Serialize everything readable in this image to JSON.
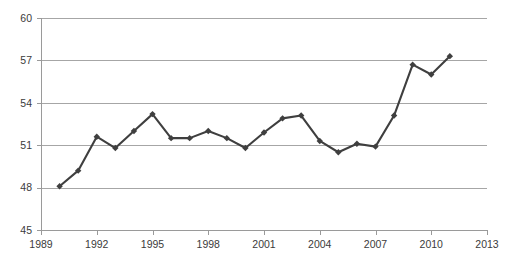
{
  "chart_data": {
    "type": "line",
    "title": "",
    "subtitle": "",
    "xlabel": "",
    "ylabel": "",
    "xlim": [
      1989,
      2013
    ],
    "ylim": [
      45,
      60
    ],
    "xticks": [
      1989,
      1992,
      1995,
      1998,
      2001,
      2004,
      2007,
      2010,
      2013
    ],
    "yticks": [
      45,
      48,
      51,
      54,
      57,
      60
    ],
    "xtick_labels": [
      "1989",
      "1992",
      "1995",
      "1998",
      "2001",
      "2004",
      "2007",
      "2010",
      "2013"
    ],
    "ytick_labels": [
      "45",
      "48",
      "51",
      "54",
      "57",
      "60"
    ],
    "grid": "horizontal",
    "legend": "none",
    "legend_entries": [],
    "annotations": [],
    "marker": "diamond",
    "line_color": "#3f3f3f",
    "marker_color": "#3f3f3f",
    "gridline_color": "#a6a6a6",
    "background_color": "#ffffff",
    "x": [
      1990,
      1991,
      1992,
      1993,
      1994,
      1995,
      1996,
      1997,
      1998,
      1999,
      2000,
      2001,
      2002,
      2003,
      2004,
      2005,
      2006,
      2007,
      2008,
      2009,
      2010,
      2011
    ],
    "series": [
      {
        "name": "series-1",
        "values": [
          48.1,
          49.2,
          51.6,
          50.8,
          52.0,
          53.2,
          51.5,
          51.5,
          52.0,
          51.5,
          50.8,
          51.9,
          52.9,
          53.1,
          51.3,
          50.5,
          51.1,
          50.9,
          53.1,
          56.7,
          56.0,
          57.3
        ]
      }
    ]
  }
}
